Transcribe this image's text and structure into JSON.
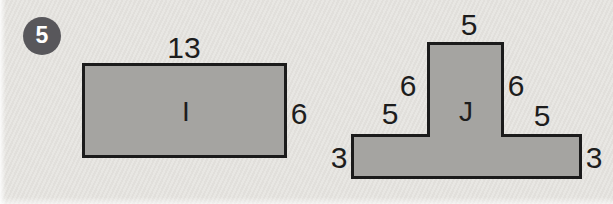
{
  "colors": {
    "background": "#e4e2de",
    "shape_fill": "#a5a4a1",
    "shape_border": "#1b1b1b",
    "badge_bg": "#58575b",
    "badge_text": "#ffffff",
    "label_text": "#1d1d1d"
  },
  "badge": {
    "number": "5"
  },
  "figure": {
    "shape_i": {
      "name": "I",
      "top": "13",
      "right": "6"
    },
    "shape_j": {
      "name": "J",
      "top": "5",
      "upper_left": "6",
      "upper_right": "6",
      "arm_left": "5",
      "arm_right": "5",
      "side_left": "3",
      "side_right": "3"
    }
  }
}
